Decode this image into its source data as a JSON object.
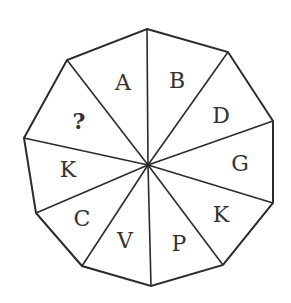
{
  "figure": {
    "type": "decagon-letter-puzzle",
    "center": [
      148,
      165
    ],
    "vertices": [
      [
        147,
        29
      ],
      [
        228,
        52
      ],
      [
        273,
        121
      ],
      [
        273,
        203
      ],
      [
        223,
        265
      ],
      [
        151,
        286
      ],
      [
        82,
        266
      ],
      [
        36,
        213
      ],
      [
        24,
        138
      ],
      [
        67,
        60
      ]
    ],
    "colors": {
      "line": "#2b2b2b",
      "text": "#333333",
      "background": "#ffffff"
    },
    "segments": [
      {
        "label": "A",
        "pos": [
          123,
          82
        ]
      },
      {
        "label": "B",
        "pos": [
          177,
          80
        ]
      },
      {
        "label": "D",
        "pos": [
          221,
          115
        ]
      },
      {
        "label": "G",
        "pos": [
          240,
          163
        ]
      },
      {
        "label": "K",
        "pos": [
          221,
          214
        ]
      },
      {
        "label": "P",
        "pos": [
          179,
          243
        ]
      },
      {
        "label": "V",
        "pos": [
          125,
          240
        ]
      },
      {
        "label": "C",
        "pos": [
          82,
          218
        ]
      },
      {
        "label": "K",
        "pos": [
          68,
          169
        ]
      },
      {
        "label": "?",
        "pos": [
          79,
          121
        ]
      }
    ]
  }
}
